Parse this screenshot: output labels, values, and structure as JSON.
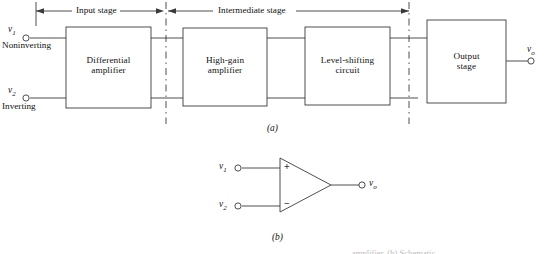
{
  "figure": {
    "caption_a": "(a)",
    "caption_b": "(b)",
    "cut_caption": "amplifier.   (b) Schematic"
  },
  "diagram_a": {
    "stages": [
      {
        "name": "input-stage",
        "label": "Input stage"
      },
      {
        "name": "intermediate-stage",
        "label": "Intermediate stage"
      }
    ],
    "blocks": [
      {
        "name": "differential-amplifier",
        "line1": "Differential",
        "line2": "amplifier"
      },
      {
        "name": "high-gain-amplifier",
        "line1": "High-gain",
        "line2": "amplifier"
      },
      {
        "name": "level-shifting-circuit",
        "line1": "Level-shifting",
        "line2": "circuit"
      },
      {
        "name": "output-stage",
        "line1": "Output",
        "line2": "stage"
      }
    ],
    "terminals": {
      "v1_symbol": "v",
      "v1_sub": "1",
      "v1_role": "Noninverting",
      "v2_symbol": "v",
      "v2_sub": "2",
      "v2_role": "Inverting",
      "vo_symbol": "v",
      "vo_sub": "o"
    }
  },
  "diagram_b": {
    "terminals": {
      "v1_symbol": "v",
      "v1_sub": "1",
      "v2_symbol": "v",
      "v2_sub": "2",
      "vo_symbol": "v",
      "vo_sub": "o"
    },
    "signs": {
      "plus": "+",
      "minus": "−"
    }
  },
  "colors": {
    "ink": "#1a1a1a",
    "line": "#3a3a3a",
    "paper": "#ffffff",
    "faded": "#b9b9b9"
  }
}
